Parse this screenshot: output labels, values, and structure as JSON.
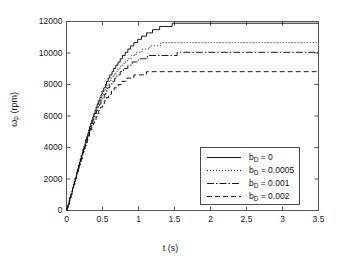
{
  "chart_data": {
    "type": "line",
    "title": "",
    "xlabel": "t (s)",
    "ylabel": "ω_p (rpm)",
    "ylabel_base": "ω",
    "ylabel_sub": "p",
    "ylabel_unit": " (rpm)",
    "xlim": [
      0,
      3.5
    ],
    "ylim": [
      0,
      12000
    ],
    "xticks": [
      0,
      0.5,
      1,
      1.5,
      2,
      2.5,
      3,
      3.5
    ],
    "xticklabels": [
      "0",
      "0.5",
      "1",
      "1.5",
      "2",
      "2.5",
      "3",
      "3.5"
    ],
    "yticks": [
      0,
      2000,
      4000,
      6000,
      8000,
      10000,
      12000
    ],
    "yticklabels": [
      "0",
      "2000",
      "4000",
      "6000",
      "8000",
      "10000",
      "12000"
    ],
    "grid": false,
    "legend_position": "lower right",
    "line_color": "#000000",
    "series": [
      {
        "name": "b_D = 0",
        "label_base": "b",
        "label_sub": "D",
        "label_rest": " = 0",
        "style": "solid",
        "dash": "none",
        "steady_state": 11950,
        "x": [
          0,
          0.05,
          0.1,
          0.15,
          0.2,
          0.25,
          0.3,
          0.35,
          0.4,
          0.45,
          0.5,
          0.55,
          0.6,
          0.65,
          0.7,
          0.75,
          0.8,
          0.85,
          0.9,
          0.95,
          1,
          1.1,
          1.2,
          1.3,
          1.4,
          1.5,
          1.6,
          1.7,
          1.8,
          2,
          2.2,
          2.4,
          2.6,
          2.8,
          3,
          3.2,
          3.5
        ],
        "y": [
          0,
          800,
          1650,
          2500,
          3350,
          4150,
          4950,
          5700,
          6400,
          7000,
          7550,
          8050,
          8500,
          8900,
          9270,
          9600,
          9900,
          10170,
          10410,
          10630,
          10830,
          11160,
          11410,
          11600,
          11730,
          11820,
          11880,
          11910,
          11930,
          11945,
          11950,
          11950,
          11950,
          11950,
          11950,
          11950,
          11950
        ]
      },
      {
        "name": "b_D = 0.0005",
        "label_base": "b",
        "label_sub": "D",
        "label_rest": " = 0.0005",
        "style": "dotted",
        "dash": "1,2",
        "steady_state": 10750,
        "x": [
          0,
          0.05,
          0.1,
          0.15,
          0.2,
          0.25,
          0.3,
          0.35,
          0.4,
          0.45,
          0.5,
          0.55,
          0.6,
          0.65,
          0.7,
          0.75,
          0.8,
          0.85,
          0.9,
          0.95,
          1,
          1.1,
          1.2,
          1.3,
          1.4,
          1.5,
          1.6,
          1.8,
          2,
          2.2,
          2.5,
          3,
          3.5
        ],
        "y": [
          0,
          800,
          1640,
          2480,
          3310,
          4100,
          4870,
          5590,
          6260,
          6830,
          7340,
          7790,
          8190,
          8540,
          8850,
          9120,
          9360,
          9570,
          9750,
          9910,
          10050,
          10270,
          10430,
          10550,
          10640,
          10690,
          10720,
          10745,
          10750,
          10750,
          10750,
          10750,
          10750
        ]
      },
      {
        "name": "b_D = 0.001",
        "label_base": "b",
        "label_sub": "D",
        "label_rest": " = 0.001",
        "style": "dashdot",
        "dash": "7,2,1.5,2",
        "steady_state": 9950,
        "x": [
          0,
          0.05,
          0.1,
          0.15,
          0.2,
          0.25,
          0.3,
          0.35,
          0.4,
          0.45,
          0.5,
          0.55,
          0.6,
          0.65,
          0.7,
          0.75,
          0.8,
          0.85,
          0.9,
          0.95,
          1,
          1.1,
          1.2,
          1.3,
          1.4,
          1.5,
          1.6,
          1.8,
          2,
          2.3,
          2.7,
          3.1,
          3.5
        ],
        "y": [
          0,
          790,
          1630,
          2460,
          3270,
          4040,
          4790,
          5480,
          6110,
          6650,
          7130,
          7550,
          7910,
          8230,
          8510,
          8750,
          8960,
          9140,
          9300,
          9430,
          9540,
          9710,
          9820,
          9890,
          9925,
          9940,
          9948,
          9950,
          9950,
          9950,
          9950,
          9950,
          9950
        ]
      },
      {
        "name": "b_D = 0.002",
        "label_base": "b",
        "label_sub": "D",
        "label_rest": " = 0.002",
        "style": "dashed",
        "dash": "5,3",
        "steady_state": 8800,
        "x": [
          0,
          0.05,
          0.1,
          0.15,
          0.2,
          0.25,
          0.3,
          0.35,
          0.4,
          0.45,
          0.5,
          0.55,
          0.6,
          0.65,
          0.7,
          0.75,
          0.8,
          0.85,
          0.9,
          0.95,
          1,
          1.1,
          1.2,
          1.3,
          1.4,
          1.5,
          1.7,
          1.9,
          2.2,
          2.6,
          3,
          3.5
        ],
        "y": [
          0,
          780,
          1600,
          2410,
          3190,
          3920,
          4610,
          5240,
          5800,
          6280,
          6700,
          7060,
          7370,
          7640,
          7860,
          8050,
          8210,
          8340,
          8450,
          8540,
          8610,
          8710,
          8770,
          8790,
          8797,
          8800,
          8800,
          8800,
          8800,
          8800,
          8800,
          8800
        ]
      }
    ]
  }
}
